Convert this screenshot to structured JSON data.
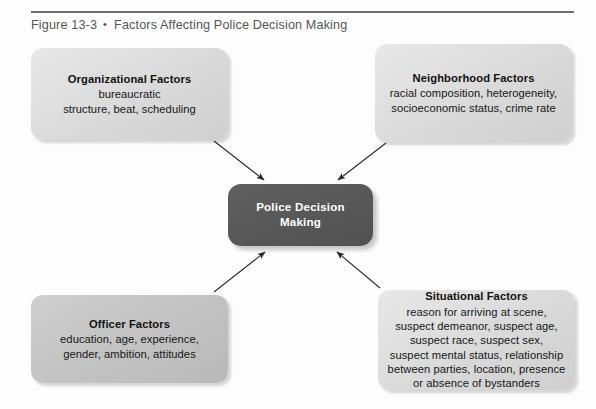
{
  "figure": {
    "number": "Figure 13-3",
    "bullet": "•",
    "title": "Factors Affecting Police Decision Making"
  },
  "diagram": {
    "type": "hub-and-spoke",
    "center": {
      "id": "police-decision-making",
      "label": "Police Decision Making",
      "fill": "#585858",
      "text_color": "#ffffff"
    },
    "nodes": [
      {
        "id": "organizational-factors",
        "position": "top-left",
        "title": "Organizational Factors",
        "body": "bureaucratic\nstructure, beat, scheduling",
        "fill": "#dcdcdc"
      },
      {
        "id": "neighborhood-factors",
        "position": "top-right",
        "title": "Neighborhood Factors",
        "body": "racial composition, heterogeneity,\nsocioeconomic status, crime rate",
        "fill": "#d4d4d4"
      },
      {
        "id": "officer-factors",
        "position": "bottom-left",
        "title": "Officer Factors",
        "body": "education, age, experience,\ngender, ambition, attitudes",
        "fill": "#c4c4c4"
      },
      {
        "id": "situational-factors",
        "position": "bottom-right",
        "title": "Situational Factors",
        "body": "reason for arriving at scene,\nsuspect demeanor, suspect age,\nsuspect race, suspect sex,\nsuspect mental status, relationship\nbetween parties, location, presence\nor absence of bystanders",
        "fill": "#d4d4d4"
      }
    ],
    "arrows": [
      {
        "id": "arrow-organizational-to-center",
        "from": "organizational-factors",
        "to": "police-decision-making",
        "direction": "down-right"
      },
      {
        "id": "arrow-neighborhood-to-center",
        "from": "neighborhood-factors",
        "to": "police-decision-making",
        "direction": "down-left"
      },
      {
        "id": "arrow-officer-to-center",
        "from": "officer-factors",
        "to": "police-decision-making",
        "direction": "up-right"
      },
      {
        "id": "arrow-situational-to-center",
        "from": "situational-factors",
        "to": "police-decision-making",
        "direction": "up-left"
      }
    ]
  }
}
